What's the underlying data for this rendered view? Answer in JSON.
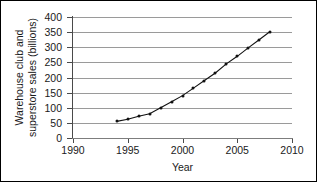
{
  "chart_data": {
    "type": "line",
    "title": "",
    "xlabel": "Year",
    "ylabel": "Warehouse club and superstore sales (billions)",
    "ylabel_lines": [
      "Warehouse club and",
      "superstore sales (billions)"
    ],
    "xlim": [
      1990,
      2010
    ],
    "ylim": [
      0,
      400
    ],
    "xticks": [
      1990,
      1995,
      2000,
      2005,
      2010
    ],
    "yticks": [
      0,
      50,
      100,
      150,
      200,
      250,
      300,
      350,
      400
    ],
    "grid": "horizontal",
    "legend": "none",
    "marker": "filled-diamond",
    "line_color": "#111111",
    "grid_color": "#9a9a9a",
    "x": [
      1994,
      1995,
      1996,
      1997,
      1998,
      1999,
      2000,
      2001,
      2002,
      2003,
      2004,
      2005,
      2006,
      2007,
      2008
    ],
    "values": [
      55,
      62,
      72,
      80,
      100,
      120,
      140,
      165,
      190,
      215,
      245,
      270,
      298,
      325,
      352
    ],
    "series": [
      {
        "name": "Warehouse club and superstore sales",
        "values": [
          55,
          62,
          72,
          80,
          100,
          120,
          140,
          165,
          190,
          215,
          245,
          270,
          298,
          325,
          352
        ]
      }
    ]
  }
}
